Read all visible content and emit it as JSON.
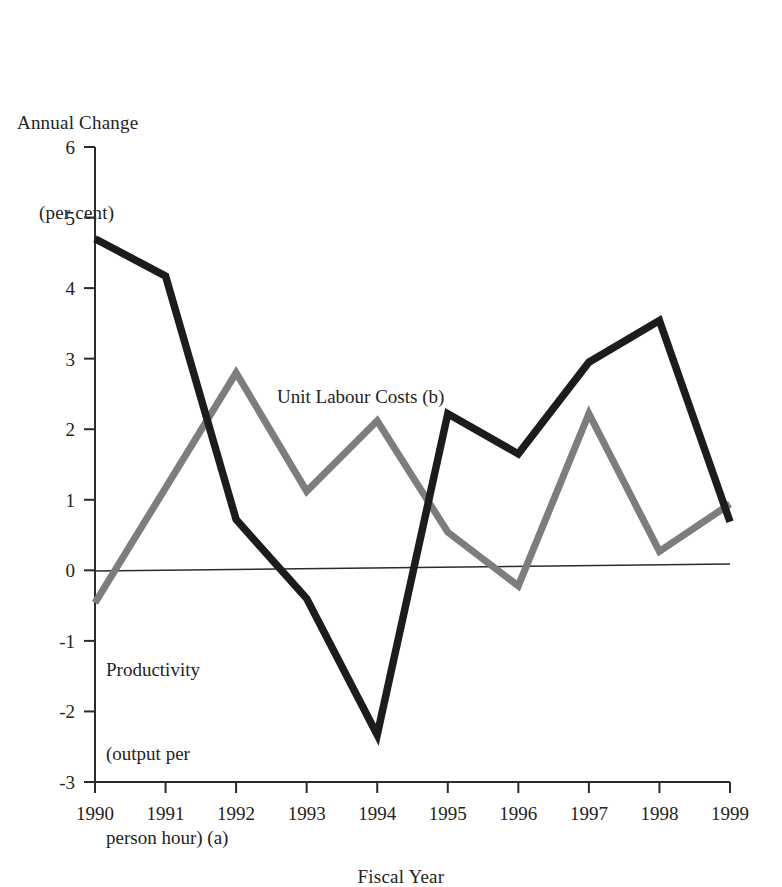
{
  "chart_data": {
    "type": "line",
    "title": "",
    "ylabel": "Annual Change\n(per cent)",
    "ylabel_line1": "Annual Change",
    "ylabel_line2": "(per cent)",
    "xlabel": "Fiscal Year",
    "categories": [
      "1990",
      "1991",
      "1992",
      "1993",
      "1994",
      "1995",
      "1996",
      "1997",
      "1998",
      "1999"
    ],
    "x": [
      1990,
      1991,
      1992,
      1993,
      1994,
      1995,
      1996,
      1997,
      1998,
      1999
    ],
    "ylim": [
      -3,
      6
    ],
    "xlim": [
      1990,
      1999
    ],
    "yticks": [
      -3,
      -2,
      -1,
      0,
      1,
      2,
      3,
      4,
      5,
      6
    ],
    "ytick_labels": [
      "-3",
      "-2",
      "-1",
      "0",
      "1",
      "2",
      "3",
      "4",
      "5",
      "6"
    ],
    "grid": false,
    "zero_line": true,
    "legend_position": "inline-annotations",
    "series": [
      {
        "name": "Productivity (output per person hour) (a)",
        "color": "#1c1c1c",
        "values": [
          4.7,
          4.17,
          0.72,
          -0.4,
          -2.33,
          2.22,
          1.65,
          2.95,
          3.54,
          0.69
        ]
      },
      {
        "name": "Unit Labour Costs (b)",
        "color": "#7d7d7d",
        "values": [
          -0.46,
          1.17,
          2.8,
          1.12,
          2.12,
          0.54,
          -0.22,
          2.22,
          0.27,
          0.94
        ]
      }
    ],
    "annotations": [
      {
        "name": "unit-labour-costs-label",
        "text": "Unit Labour Costs (b)",
        "lines": [
          "Unit Labour Costs (b)"
        ],
        "color": "#7d7d7d"
      },
      {
        "name": "productivity-label",
        "text": "Productivity (output per person hour) (a)",
        "lines": [
          "Productivity",
          "(output per",
          "person hour) (a)"
        ],
        "color": "#1c1c1c"
      }
    ]
  },
  "axes": {
    "y_title_line1": "Annual Change",
    "y_title_line2": "(per cent)",
    "x_title": "Fiscal Year"
  },
  "annotations": {
    "ulc": "Unit Labour Costs (b)",
    "prod_line1": "Productivity",
    "prod_line2": "(output per",
    "prod_line3": "person hour) (a)"
  },
  "colors": {
    "productivity": "#1c1c1c",
    "unit_labour_costs": "#7d7d7d",
    "axis": "#2b2b2b",
    "background": "#ffffff"
  }
}
